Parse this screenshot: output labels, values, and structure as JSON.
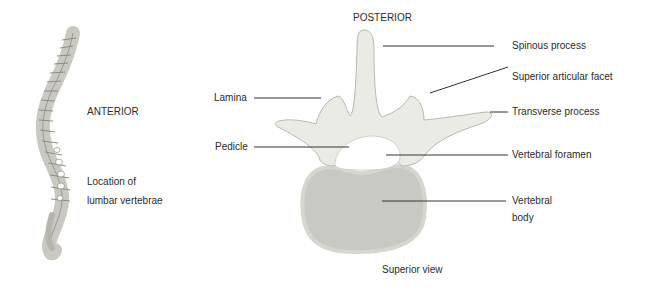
{
  "diagram": {
    "orientation_top": "POSTERIOR",
    "orientation_left": "ANTERIOR",
    "spine_caption_line1": "Location of",
    "spine_caption_line2": "lumbar vertebrae",
    "view_caption": "Superior view",
    "labels_left": [
      {
        "text": "Lamina"
      },
      {
        "text": "Pedicle"
      }
    ],
    "labels_right": [
      {
        "text": "Spinous process"
      },
      {
        "text": "Superior articular facet"
      },
      {
        "text": "Transverse process"
      },
      {
        "text": "Vertebral foramen"
      },
      {
        "text": "Vertebral"
      },
      {
        "text": "body"
      }
    ],
    "colors": {
      "bone_fill": "#ebebe6",
      "bone_outline": "#b8b8b0",
      "body_fill": "#c9c9c4",
      "leader_line": "#333333"
    }
  }
}
